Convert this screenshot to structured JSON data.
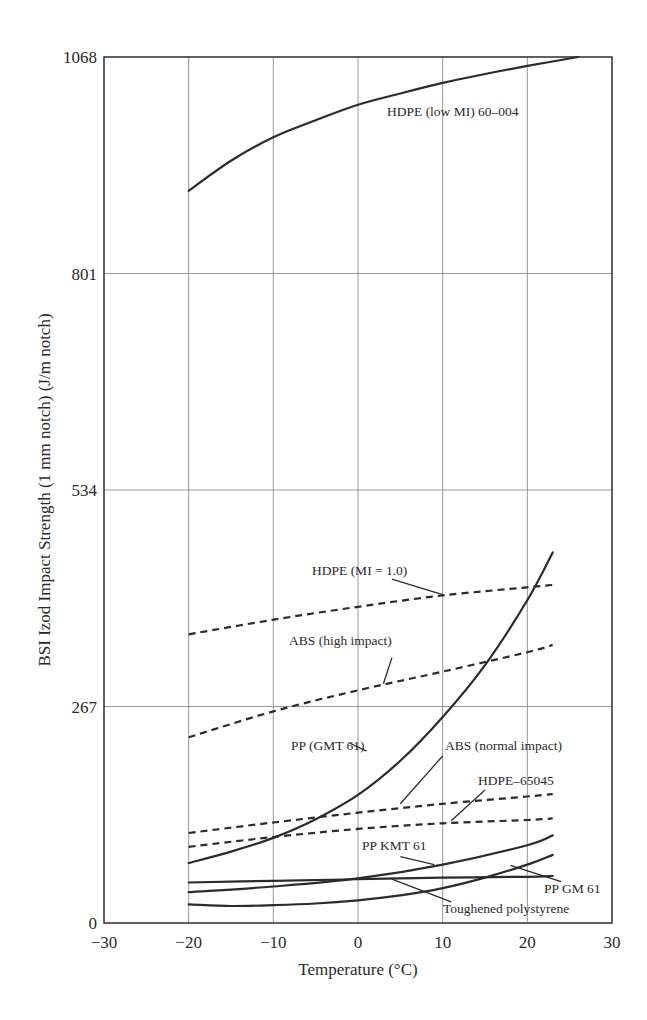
{
  "chart_data": {
    "type": "line",
    "title": "",
    "xlabel": "Temperature (°C)",
    "ylabel": "BSI Izod Impact Strength (1 mm notch) (J/m notch)",
    "xlim": [
      -30,
      30
    ],
    "ylim": [
      0,
      1068
    ],
    "x_ticks": [
      -30,
      -20,
      -10,
      0,
      10,
      20,
      30
    ],
    "x_tick_labels": [
      "−30",
      "−20",
      "−10",
      "0",
      "10",
      "20",
      "30"
    ],
    "y_ticks": [
      0,
      267,
      534,
      801,
      1068
    ],
    "y_tick_labels": [
      "0",
      "267",
      "534",
      "801",
      "1068"
    ],
    "grid": true,
    "legend": "none (inline annotations)",
    "series": [
      {
        "name": "HDPE (low MI) 60–004",
        "style": "solid",
        "x": [
          -20,
          -15,
          -10,
          -5,
          0,
          5,
          10,
          15,
          20,
          26
        ],
        "values": [
          903,
          940,
          969,
          990,
          1009,
          1023,
          1036,
          1047,
          1057,
          1068
        ],
        "label_pos": [
          5,
          1000
        ]
      },
      {
        "name": "HDPE (MI = 1.0)",
        "style": "dashed",
        "x": [
          -20,
          -10,
          0,
          10,
          20,
          23
        ],
        "values": [
          356,
          374,
          390,
          404,
          414,
          417
        ],
        "label_pos": [
          -6,
          435
        ],
        "leader": [
          [
            4,
            424
          ],
          [
            10,
            405
          ]
        ]
      },
      {
        "name": "ABS (high impact)",
        "style": "dashed",
        "x": [
          -20,
          -10,
          0,
          10,
          20,
          23
        ],
        "values": [
          229,
          261,
          287,
          310,
          334,
          343
        ],
        "label_pos": [
          -5,
          338
        ],
        "leader": [
          [
            4,
            327
          ],
          [
            3,
            295
          ]
        ]
      },
      {
        "name": "PP (GMT 61)",
        "style": "solid",
        "x": [
          -20,
          -15,
          -10,
          -5,
          0,
          5,
          10,
          15,
          20,
          23
        ],
        "values": [
          74,
          88,
          105,
          128,
          158,
          200,
          254,
          318,
          398,
          457
        ],
        "label_pos": [
          -8,
          226
        ],
        "leader": [
          [
            -1,
            222
          ],
          [
            1,
            212
          ]
        ]
      },
      {
        "name": "ABS (normal impact)",
        "style": "dashed",
        "x": [
          -20,
          -10,
          0,
          10,
          20,
          23
        ],
        "values": [
          111,
          124,
          136,
          147,
          156,
          159
        ],
        "label_pos": [
          16,
          226
        ],
        "leader": [
          [
            10,
            206
          ],
          [
            5,
            147
          ]
        ]
      },
      {
        "name": "HDPE–65045",
        "style": "dashed",
        "x": [
          -20,
          -10,
          0,
          10,
          20,
          23
        ],
        "values": [
          94,
          106,
          116,
          123,
          127,
          129
        ],
        "label_pos": [
          18,
          180
        ],
        "leader": [
          [
            15,
            164
          ],
          [
            11,
            126
          ]
        ]
      },
      {
        "name": "PP KMT 61",
        "style": "solid",
        "x": [
          -20,
          -10,
          0,
          10,
          20,
          23
        ],
        "values": [
          38,
          45,
          55,
          72,
          96,
          108
        ],
        "label_pos": [
          6,
          94
        ],
        "leader": [
          [
            5,
            82
          ],
          [
            9,
            72
          ]
        ]
      },
      {
        "name": "Toughened polystyrene",
        "style": "solid",
        "x": [
          -20,
          -10,
          0,
          10,
          20,
          23
        ],
        "values": [
          50,
          52,
          54,
          56,
          57,
          58
        ],
        "label_pos": [
          20,
          22
        ],
        "leader": [
          [
            4,
            54
          ],
          [
            11,
            26
          ]
        ]
      },
      {
        "name": "PP GM 61",
        "style": "solid",
        "x": [
          -20,
          -15,
          -10,
          -5,
          0,
          5,
          10,
          15,
          20,
          23
        ],
        "values": [
          23,
          21,
          22,
          24,
          28,
          34,
          43,
          56,
          72,
          84
        ],
        "label_pos": [
          26,
          38
        ],
        "leader": [
          [
            18,
            71
          ],
          [
            24,
            51
          ]
        ]
      }
    ]
  },
  "axes": {
    "x_title": "Temperature (°C)",
    "y_title": "BSI Izod Impact Strength (1 mm notch) (J/m notch)"
  },
  "annotations": {
    "hdpe_low_mi": "HDPE (low MI) 60–004",
    "hdpe_mi_1": "HDPE (MI = 1.0)",
    "abs_high": "ABS (high impact)",
    "pp_gmt": "PP (GMT 61)",
    "abs_normal": "ABS (normal impact)",
    "hdpe_65045": "HDPE–65045",
    "pp_kmt": "PP KMT 61",
    "pp_gm": "PP GM 61",
    "toughened_ps": "Toughened polystyrene"
  }
}
